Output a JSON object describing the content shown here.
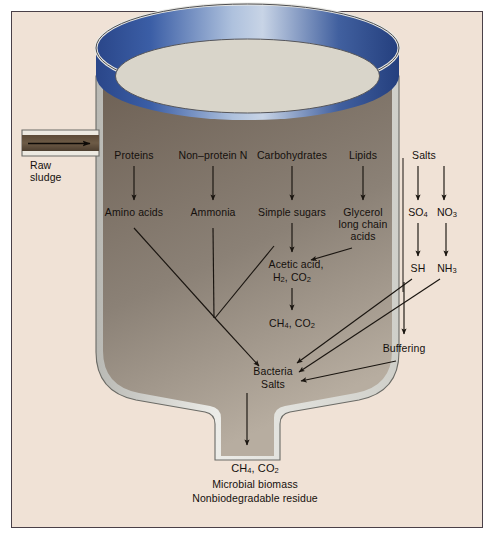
{
  "figure": {
    "frame_color": "#4a4048",
    "background_color": "#f0e2d6",
    "tank_wall_color": "#d8d8d4",
    "tank_liquid_color": "#7d7066",
    "tank_rim_blue": "#2e4f96",
    "tank_top_fill": "#d7d3c8"
  },
  "inlet": {
    "label_line1": "Raw",
    "label_line2": "sludge",
    "arrow": "inlet-arrow-right"
  },
  "substrates": [
    {
      "id": "proteins",
      "label": "Proteins"
    },
    {
      "id": "nonprotein_n",
      "label": "Non–protein N"
    },
    {
      "id": "carbohydrates",
      "label": "Carbohydrates"
    },
    {
      "id": "lipids",
      "label": "Lipids"
    },
    {
      "id": "salts",
      "label": "Salts"
    }
  ],
  "intermediates": [
    {
      "id": "amino_acids",
      "label": "Amino acids"
    },
    {
      "id": "ammonia",
      "label": "Ammonia"
    },
    {
      "id": "simple_sugars",
      "label": "Simple sugars"
    },
    {
      "id": "glycerol_l1",
      "label": "Glycerol"
    },
    {
      "id": "glycerol_l2",
      "label": "long chain"
    },
    {
      "id": "glycerol_l3",
      "label": "acids"
    },
    {
      "id": "so4",
      "label": "SO",
      "sub": "4"
    },
    {
      "id": "no3",
      "label": "NO",
      "sub": "3"
    }
  ],
  "products": [
    {
      "id": "acetic_acid_l1",
      "label": "Acetic acid,"
    },
    {
      "id": "acetic_acid_l2",
      "label": "H",
      "sub": "2",
      "tail": ", CO",
      "sub2": "2"
    },
    {
      "id": "methane_mid",
      "label": "CH",
      "sub": "4",
      "tail": ", CO",
      "sub2": "2"
    },
    {
      "id": "sh",
      "label": "SH"
    },
    {
      "id": "nh3",
      "label": "NH",
      "sub": "3"
    },
    {
      "id": "buffering",
      "label": "Buffering"
    }
  ],
  "sink": {
    "line1": "Bacteria",
    "line2": "Salts"
  },
  "outputs": [
    {
      "id": "gas",
      "label": "CH",
      "sub": "4",
      "tail": ",  CO",
      "sub2": "2"
    },
    {
      "id": "biomass",
      "label": "Microbial biomass"
    },
    {
      "id": "residue",
      "label": "Nonbiodegradable residue"
    }
  ]
}
